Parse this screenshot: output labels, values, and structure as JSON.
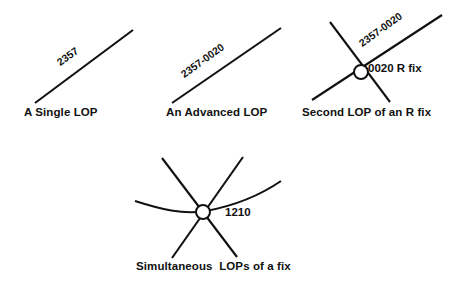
{
  "figure": {
    "background_color": "#ffffff",
    "ink_color": "#111111",
    "panels": [
      {
        "id": "single-lop",
        "caption": "A Single LOP",
        "lop_label": "2357",
        "lines": [
          {
            "name": "lop-line-2357",
            "x1": 35,
            "y1": 103,
            "x2": 133,
            "y2": 30
          }
        ],
        "curves": [],
        "fix": null
      },
      {
        "id": "advanced-lop",
        "caption": "An Advanced LOP",
        "lop_label": "2357-0020",
        "lines": [
          {
            "name": "lop-line-2357-0020",
            "x1": 172,
            "y1": 103,
            "x2": 281,
            "y2": 28
          }
        ],
        "curves": [],
        "fix": null
      },
      {
        "id": "second-lop-r-fix",
        "caption": "Second LOP of an R fix",
        "lop_label": "2357-0020",
        "fix_label": "0020 R fix",
        "lines": [
          {
            "name": "lop-line-2357-0020",
            "x1": 312,
            "y1": 100,
            "x2": 442,
            "y2": 15
          },
          {
            "name": "crossing-lop-line",
            "x1": 330,
            "y1": 22,
            "x2": 390,
            "y2": 102
          }
        ],
        "curves": [],
        "fix": {
          "name": "fix-symbol",
          "cx": 361,
          "cy": 72,
          "r": 7
        }
      },
      {
        "id": "simultaneous-lops",
        "caption": "Simultaneous  LOPs of a fix",
        "fix_label": "1210",
        "lines": [
          {
            "name": "lop-line-left-descending",
            "x1": 162,
            "y1": 158,
            "x2": 237,
            "y2": 257
          },
          {
            "name": "lop-line-right-descending",
            "x1": 243,
            "y1": 157,
            "x2": 172,
            "y2": 258
          }
        ],
        "curves": [
          {
            "name": "lop-curve-arc",
            "d": "M135,201 Q182,217 206,211 T281,181"
          }
        ],
        "fix": {
          "name": "fix-symbol",
          "cx": 203,
          "cy": 212,
          "r": 7
        }
      }
    ]
  }
}
